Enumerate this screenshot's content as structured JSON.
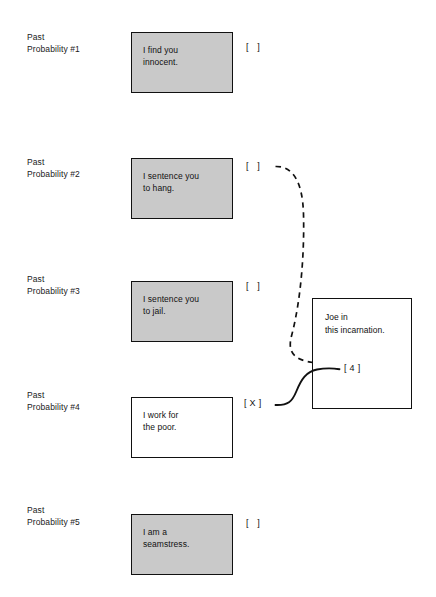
{
  "diagram": {
    "background_color": "#ffffff",
    "shaded_box_color": "#c9c9c9",
    "plain_box_color": "#ffffff",
    "line_color": "#111111",
    "rows": [
      {
        "label": "Past\nProbability #1",
        "statement": "I find you\ninnocent.",
        "marker": "[   ]",
        "shaded": true
      },
      {
        "label": "Past\nProbability #2",
        "statement": "I sentence you\nto hang.",
        "marker": "[   ]",
        "shaded": true
      },
      {
        "label": "Past\nProbability #3",
        "statement": "I sentence you\nto jail.",
        "marker": "[   ]",
        "shaded": true
      },
      {
        "label": "Past\nProbability #4",
        "statement": "I work for\nthe poor.",
        "marker": "[ X ]",
        "shaded": false
      },
      {
        "label": "Past\nProbability #5",
        "statement": "I am a\nseamstress.",
        "marker": "[   ]",
        "shaded": true
      }
    ],
    "target": {
      "text": "Joe in\nthis incarnation.",
      "tag": "[ 4 ]"
    },
    "connectors": [
      {
        "name": "dashed-connector",
        "style": "dashed",
        "from": "row-2-marker",
        "to": "target-box"
      },
      {
        "name": "solid-connector",
        "style": "solid",
        "from": "row-4-marker",
        "to": "target-tag"
      }
    ]
  }
}
